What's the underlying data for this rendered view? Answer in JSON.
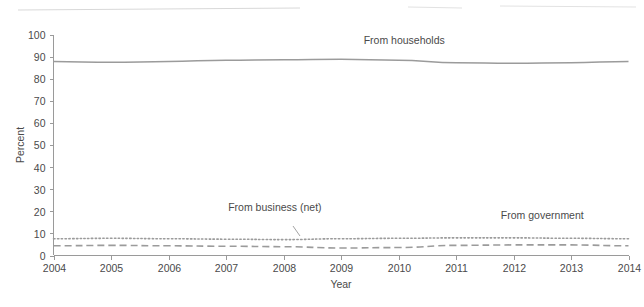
{
  "chart_data": {
    "type": "line",
    "title": "",
    "xlabel": "Year",
    "ylabel": "Percent",
    "xlim": [
      2004,
      2014
    ],
    "ylim": [
      0,
      100
    ],
    "grid": false,
    "legend_position": "inline-annotations",
    "x": [
      2004,
      2005,
      2006,
      2007,
      2008,
      2009,
      2010,
      2011,
      2012,
      2013,
      2014
    ],
    "xticks": [
      "2004",
      "2005",
      "2006",
      "2007",
      "2008",
      "2009",
      "2010",
      "2011",
      "2012",
      "2013",
      "2014"
    ],
    "yticks": [
      "0",
      "10",
      "20",
      "30",
      "40",
      "50",
      "60",
      "70",
      "80",
      "90",
      "100"
    ],
    "series": [
      {
        "name": "From households",
        "style": "solid",
        "color": "#9b9b9b",
        "values": [
          88.0,
          87.6,
          88.0,
          88.6,
          88.8,
          89.0,
          88.6,
          87.4,
          87.2,
          87.4,
          88.0
        ]
      },
      {
        "name": "From business (net)",
        "style": "dotted",
        "color": "#9b9b9b",
        "values": [
          7.6,
          7.8,
          7.6,
          7.4,
          7.2,
          7.6,
          7.8,
          8.0,
          8.0,
          7.8,
          7.6
        ]
      },
      {
        "name": "From government",
        "style": "dashed",
        "color": "#9b9b9b",
        "values": [
          4.4,
          4.6,
          4.4,
          4.2,
          4.0,
          3.4,
          3.6,
          4.6,
          4.8,
          4.8,
          4.4
        ]
      }
    ],
    "annotations": [
      {
        "text": "From households",
        "x": 2010.1,
        "y": 96,
        "anchor": "middle"
      },
      {
        "text": "From business (net)",
        "x": 2007.85,
        "y": 20,
        "anchor": "middle"
      },
      {
        "text": "From government",
        "x": 2012.5,
        "y": 16.5,
        "anchor": "middle"
      }
    ]
  }
}
